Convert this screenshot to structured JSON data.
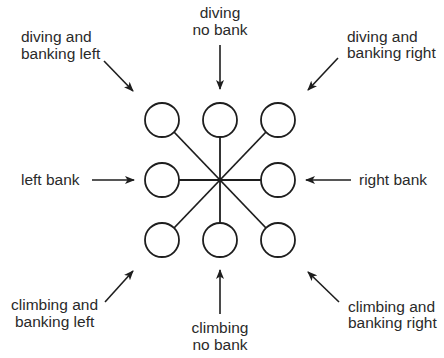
{
  "diagram": {
    "center": {
      "x": 220,
      "y": 180
    },
    "circle_radius": 17,
    "colors": {
      "line": "#1e1e1e",
      "text": "#2a2a2a",
      "background": "#ffffff"
    },
    "labels": {
      "top_left": {
        "line1": "diving and",
        "line2": "banking left"
      },
      "top": {
        "line1": "diving",
        "line2": "no bank"
      },
      "top_right": {
        "line1": "diving and",
        "line2": "banking right"
      },
      "left": {
        "line1": "left bank"
      },
      "right": {
        "line1": "right bank"
      },
      "bottom_left": {
        "line1": "climbing and",
        "line2": "banking left"
      },
      "bottom": {
        "line1": "climbing",
        "line2": "no bank"
      },
      "bottom_right": {
        "line1": "climbing and",
        "line2": "banking right"
      }
    },
    "positions": [
      {
        "id": "top-left",
        "x": 162,
        "y": 120
      },
      {
        "id": "top",
        "x": 220,
        "y": 120
      },
      {
        "id": "top-right",
        "x": 278,
        "y": 120
      },
      {
        "id": "left",
        "x": 162,
        "y": 180
      },
      {
        "id": "right",
        "x": 278,
        "y": 180
      },
      {
        "id": "bottom-left",
        "x": 162,
        "y": 240
      },
      {
        "id": "bottom",
        "x": 220,
        "y": 240
      },
      {
        "id": "bottom-right",
        "x": 278,
        "y": 240
      }
    ]
  }
}
